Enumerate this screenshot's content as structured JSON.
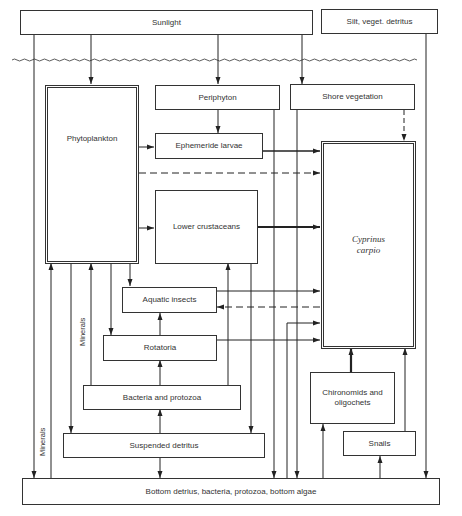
{
  "diagram": {
    "nodes": {
      "sunlight": "Sunlight",
      "silt": "Silt, veget. detritus",
      "periphyton": "Periphyton",
      "shore_vegetation": "Shore vegetation",
      "phytoplankton": "Phytoplankton",
      "ephemeride_larvae": "Ephemeride larvae",
      "lower_crustaceans": "Lower crustaceans",
      "cyprinus_carpio": "Cyprinus carpio",
      "aquatic_insects": "Aquatic insects",
      "rotatoria": "Rotatoria",
      "bacteria_protozoa": "Bacteria and protozoa",
      "chironomids": "Chironomids and oligochets",
      "suspended_detritus": "Suspended detritus",
      "snails": "Snails",
      "bottom": "Bottom detrius, bacteria, protozoa, bottom algae"
    },
    "labels": {
      "minerals_outer": "Minerals",
      "minerals_inner": "Minerals"
    },
    "edges": [
      {
        "from": "sunlight",
        "to": "bottom",
        "style": "solid"
      },
      {
        "from": "sunlight",
        "to": "phytoplankton",
        "style": "solid"
      },
      {
        "from": "sunlight",
        "to": "periphyton",
        "style": "solid"
      },
      {
        "from": "sunlight",
        "to": "shore_vegetation",
        "style": "solid"
      },
      {
        "from": "silt",
        "to": "bottom",
        "style": "solid"
      },
      {
        "from": "periphyton",
        "to": "ephemeride_larvae",
        "style": "solid"
      },
      {
        "from": "periphyton",
        "to": "bottom",
        "style": "solid"
      },
      {
        "from": "shore_vegetation",
        "to": "cyprinus_carpio",
        "style": "dashed"
      },
      {
        "from": "shore_vegetation",
        "to": "bottom",
        "style": "solid"
      },
      {
        "from": "phytoplankton",
        "to": "ephemeride_larvae",
        "style": "solid"
      },
      {
        "from": "phytoplankton",
        "to": "cyprinus_carpio",
        "style": "dashed"
      },
      {
        "from": "phytoplankton",
        "to": "lower_crustaceans",
        "style": "solid"
      },
      {
        "from": "phytoplankton",
        "to": "aquatic_insects",
        "style": "solid"
      },
      {
        "from": "phytoplankton",
        "to": "rotatoria",
        "style": "solid"
      },
      {
        "from": "phytoplankton",
        "to": "suspended_detritus",
        "style": "solid"
      },
      {
        "from": "ephemeride_larvae",
        "to": "cyprinus_carpio",
        "style": "bold"
      },
      {
        "from": "lower_crustaceans",
        "to": "cyprinus_carpio",
        "style": "bold"
      },
      {
        "from": "lower_crustaceans",
        "to": "suspended_detritus",
        "style": "solid"
      },
      {
        "from": "aquatic_insects",
        "to": "cyprinus_carpio",
        "style": "solid"
      },
      {
        "from": "cyprinus_carpio",
        "to": "aquatic_insects",
        "style": "dashed"
      },
      {
        "from": "rotatoria",
        "to": "aquatic_insects",
        "style": "solid"
      },
      {
        "from": "rotatoria",
        "to": "cyprinus_carpio",
        "style": "solid"
      },
      {
        "from": "bacteria_protozoa",
        "to": "rotatoria",
        "style": "solid"
      },
      {
        "from": "bacteria_protozoa",
        "to": "lower_crustaceans",
        "style": "solid"
      },
      {
        "from": "bacteria_protozoa",
        "to": "phytoplankton",
        "style": "solid",
        "label": "Minerals"
      },
      {
        "from": "suspended_detritus",
        "to": "bacteria_protozoa",
        "style": "solid"
      },
      {
        "from": "bottom",
        "to": "suspended_detritus",
        "style": "solid"
      },
      {
        "from": "bottom",
        "to": "phytoplankton",
        "style": "solid",
        "label": "Minerals"
      },
      {
        "from": "bottom",
        "to": "cyprinus_carpio",
        "style": "solid"
      },
      {
        "from": "bottom",
        "to": "chironomids",
        "style": "solid"
      },
      {
        "from": "bottom",
        "to": "snails",
        "style": "solid"
      },
      {
        "from": "chironomids",
        "to": "cyprinus_carpio",
        "style": "bold"
      },
      {
        "from": "snails",
        "to": "cyprinus_carpio",
        "style": "solid"
      }
    ]
  }
}
